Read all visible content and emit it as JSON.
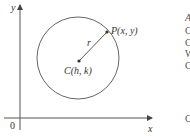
{
  "diagram": {
    "axes": {
      "x_label": "x",
      "y_label": "y",
      "origin_label": "0"
    },
    "circle": {
      "center_label": "C(h, k)",
      "point_label": "P(x, y)",
      "radius_label": "r"
    },
    "colors": {
      "stroke": "#555555",
      "text": "#333333",
      "background": "#ffffff"
    },
    "clipped_right_text": [
      "A",
      "C",
      "C",
      "W",
      "C",
      "",
      "C"
    ]
  }
}
